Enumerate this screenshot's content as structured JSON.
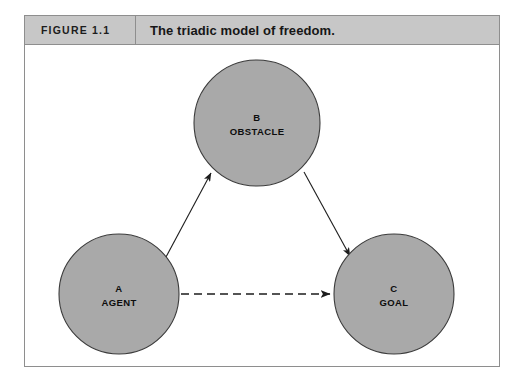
{
  "figure": {
    "label": "FIGURE 1.1",
    "title": "The triadic model of freedom."
  },
  "colors": {
    "node_fill": "#a9a9a9",
    "node_stroke": "#3b3b3b",
    "caption_bar": "#c7c7c7",
    "frame_border": "#8e8e8e",
    "canvas_background": "#ffffff",
    "edge_stroke": "#1d1d1d",
    "text": "#0d0d0d"
  },
  "diagram": {
    "type": "node-link",
    "nodes": [
      {
        "id": "A",
        "letter": "A",
        "name": "AGENT",
        "cx": 94,
        "cy": 249,
        "r": 60
      },
      {
        "id": "B",
        "letter": "B",
        "name": "OBSTACLE",
        "cx": 232,
        "cy": 78,
        "r": 63
      },
      {
        "id": "C",
        "letter": "C",
        "name": "GOAL",
        "cx": 369,
        "cy": 249,
        "r": 60
      }
    ],
    "edges": [
      {
        "from": "A",
        "to": "B",
        "style": "solid",
        "arrow": "end"
      },
      {
        "from": "B",
        "to": "C",
        "style": "solid",
        "arrow": "end"
      },
      {
        "from": "A",
        "to": "C",
        "style": "dashed",
        "arrow": "end"
      }
    ]
  }
}
